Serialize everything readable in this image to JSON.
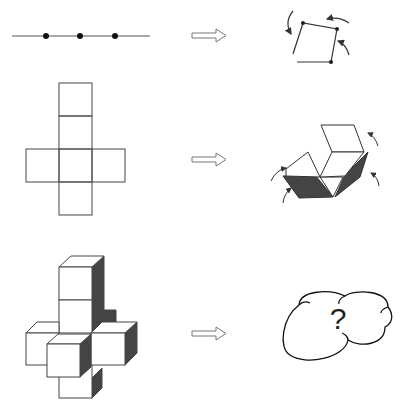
{
  "rows": [
    {
      "name": "line-to-square",
      "left": "Line segment with 3 hinge points",
      "right": "Line folded into a square with rotation arrows"
    },
    {
      "name": "net-to-cube",
      "left": "Cross-shaped cube net (6 squares)",
      "right": "Net partially folded into a cube with rotation arrows"
    },
    {
      "name": "polycube-to-unknown",
      "left": "3D polycube cross structure",
      "right": "Thought cloud with question mark"
    }
  ],
  "cloud": {
    "text": "?"
  },
  "colors": {
    "stroke": "#333333",
    "shade": "#444444",
    "background": "#ffffff"
  }
}
